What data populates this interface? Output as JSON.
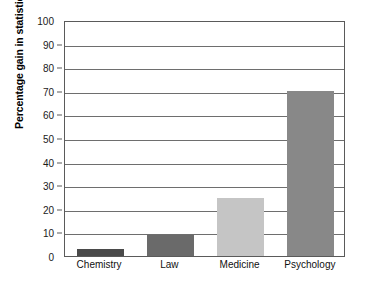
{
  "chart_data": {
    "type": "bar",
    "title": "",
    "subtitle": "",
    "xlabel": "",
    "ylabel": "Percentage gain in statistical reasoning",
    "categories": [
      "Chemistry",
      "Law",
      "Medicine",
      "Psychology"
    ],
    "values": [
      3,
      9,
      24.5,
      70
    ],
    "bar_colors": [
      "#4a4a4a",
      "#6a6a6a",
      "#c5c5c5",
      "#888888"
    ],
    "ylim": [
      0,
      100
    ],
    "ytick_values": [
      0,
      10,
      20,
      30,
      40,
      50,
      60,
      70,
      80,
      90,
      100
    ],
    "ytick_labels": [
      "0",
      "10",
      "20",
      "30",
      "40",
      "50",
      "60",
      "70",
      "80",
      "90",
      "100"
    ],
    "grid": "horizontal",
    "legend": "none",
    "frame_color": "#5a5a5a",
    "gridline_color": "#6e6e6e",
    "background": "#ffffff"
  }
}
